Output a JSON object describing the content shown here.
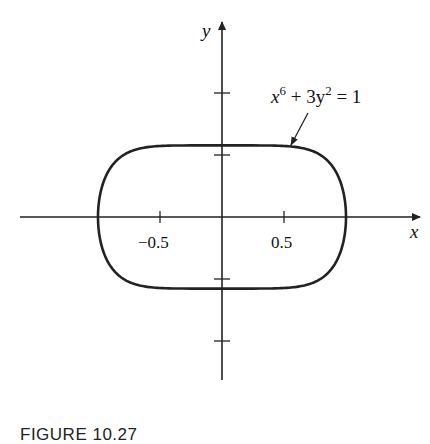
{
  "figure": {
    "caption": "FIGURE 10.27",
    "equation": {
      "base_x": "x",
      "exp_x": "6",
      "middle": " + 3y",
      "exp_y": "2",
      "rhs": " = 1"
    },
    "axes": {
      "x_label": "x",
      "y_label": "y",
      "x_tick_labels": [
        "−0.5",
        "0.5"
      ]
    }
  },
  "chart_data": {
    "type": "line",
    "title": "",
    "curve_equation": "x^6 + 3y^2 = 1",
    "xlabel": "x",
    "ylabel": "y",
    "x_ticks": [
      -0.5,
      0.5
    ],
    "x_tick_labels": [
      "−0.5",
      "0.5"
    ],
    "y_ticks": [
      -1,
      -0.5,
      0.5,
      1
    ],
    "x_extent_of_curve": [
      -1,
      1
    ],
    "y_extent_of_curve": [
      -0.577,
      0.577
    ],
    "xlim": [
      -1.63,
      1.6
    ],
    "ylim": [
      -1.31,
      1.57
    ],
    "grid": false,
    "legend": null
  }
}
